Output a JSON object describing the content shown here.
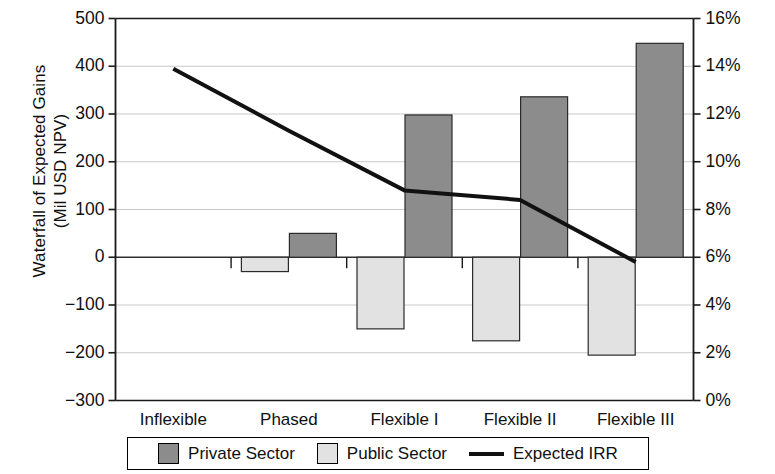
{
  "chart_data": {
    "type": "bar",
    "title": "",
    "subtitle": "",
    "xlabel": "",
    "ylabel": "Waterfall of Expected Gains (Mil USD NPV)",
    "ylabel_line1": "Waterfall of Expected Gains",
    "ylabel_line2": "(Mil USD NPV)",
    "y2label": "",
    "categories": [
      "Inflexible",
      "Phased",
      "Flexible I",
      "Flexible II",
      "Flexible III"
    ],
    "series": [
      {
        "name": "Public Sector",
        "type": "bar",
        "axis": "left",
        "color": "#e2e2e2",
        "values": [
          0,
          -30,
          -150,
          -175,
          -205
        ]
      },
      {
        "name": "Private Sector",
        "type": "bar",
        "axis": "left",
        "color": "#8c8c8c",
        "values": [
          0,
          50,
          298,
          336,
          448
        ]
      },
      {
        "name": "Expected IRR",
        "type": "line",
        "axis": "right",
        "color": "#111111",
        "values": [
          0.139,
          0.113,
          0.088,
          0.084,
          0.058
        ],
        "value_labels": [
          "13.9%",
          "11.3%",
          "8.8%",
          "8.4%",
          "5.8%"
        ]
      }
    ],
    "ylim": [
      -300,
      500
    ],
    "ytick_step": 100,
    "yticks": [
      500,
      400,
      300,
      200,
      100,
      0,
      -100,
      -200,
      -300
    ],
    "ytick_labels": [
      "500",
      "400",
      "300",
      "200",
      "100",
      "0",
      "−100",
      "−200",
      "−300"
    ],
    "y2lim": [
      0,
      0.16
    ],
    "y2tick_step": 0.02,
    "y2ticks": [
      0.16,
      0.14,
      0.12,
      0.1,
      0.08,
      0.06,
      0.04,
      0.02,
      0.0
    ],
    "y2tick_labels": [
      "16%",
      "14%",
      "12%",
      "10%",
      "8%",
      "6%",
      "4%",
      "2%",
      "0%"
    ],
    "grid": true,
    "grid_axis": "y",
    "legend_position": "bottom",
    "legend": [
      {
        "label": "Private Sector",
        "marker": "swatch",
        "color": "#8c8c8c"
      },
      {
        "label": "Public Sector",
        "marker": "swatch",
        "color": "#e2e2e2"
      },
      {
        "label": "Expected IRR",
        "marker": "line",
        "color": "#111111"
      }
    ]
  }
}
